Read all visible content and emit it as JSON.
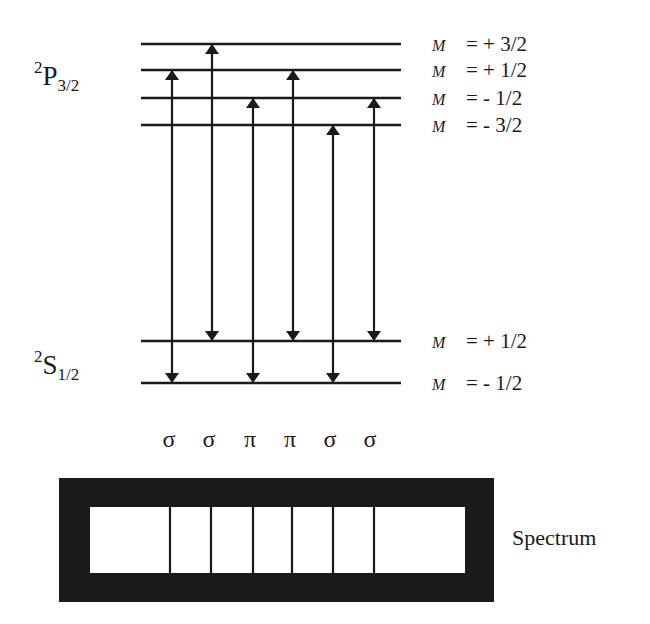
{
  "upper_term": {
    "superscript": "2",
    "letter": "P",
    "subscript": "3/2"
  },
  "lower_term": {
    "superscript": "2",
    "letter": "S",
    "subscript": "1/2"
  },
  "upper_levels": [
    {
      "m_symbol": "M",
      "value": "= + 3/2",
      "y": 44
    },
    {
      "m_symbol": "M",
      "value": "= + 1/2",
      "y": 70
    },
    {
      "m_symbol": "M",
      "value": "= - 1/2",
      "y": 98
    },
    {
      "m_symbol": "M",
      "value": "= - 3/2",
      "y": 125
    }
  ],
  "lower_levels": [
    {
      "m_symbol": "M",
      "value": "= + 1/2",
      "y": 341
    },
    {
      "m_symbol": "M",
      "value": "= - 1/2",
      "y": 383
    }
  ],
  "transitions": [
    {
      "x": 172,
      "from": "+1/2",
      "to": "-1/2",
      "type": "σ"
    },
    {
      "x": 212,
      "from": "+3/2",
      "to": "+1/2",
      "type": "σ"
    },
    {
      "x": 253,
      "from": "-1/2",
      "to": "-1/2",
      "type": "π"
    },
    {
      "x": 293,
      "from": "+1/2",
      "to": "+1/2",
      "type": "π"
    },
    {
      "x": 333,
      "from": "-3/2",
      "to": "-1/2",
      "type": "σ"
    },
    {
      "x": 374,
      "from": "-1/2",
      "to": "+1/2",
      "type": "σ"
    }
  ],
  "polarization_labels": [
    "σ",
    "σ",
    "π",
    "π",
    "σ",
    "σ"
  ],
  "spectrum": {
    "label": "Spectrum",
    "line_positions": [
      170,
      211,
      253,
      292,
      333,
      374
    ]
  },
  "colors": {
    "ink": "#1a1a1a",
    "background": "#ffffff"
  }
}
